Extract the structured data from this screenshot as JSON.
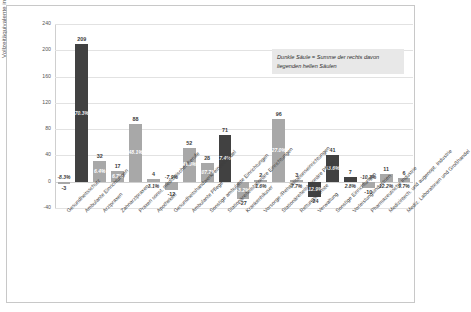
{
  "chart_data": {
    "type": "bar",
    "title": "",
    "xlabel": "",
    "ylabel": "Vollzeitäquivalente in Tausend",
    "ylim": [
      -40,
      240
    ],
    "yticks": [
      -40,
      0,
      40,
      80,
      120,
      160,
      200,
      240
    ],
    "grid": true,
    "legend": "none",
    "annotation": "Dunkle Säule = Summe der rechts davon liegenden hellen Säulen",
    "categories": [
      "Gesundheitsschutz",
      "Ambulante Einrichtungen",
      "Arztpraxen",
      "Zahnarztpraxen",
      "Praxen sonst. medizinischer Berufe",
      "Apotheken",
      "Gesundheitshandwerk/-einzelhandel",
      "Ambulante Pflege",
      "Sonstige ambulante Einrichtungen",
      "Stationäre/teilstationäre Einrichtungen",
      "Krankenhäuser",
      "Vorsorge-/Rehabilitationseinrichtungen",
      "Stationäre/teilstationäre Pflege",
      "Rettungsdienste",
      "Verwaltung",
      "Sonstige Einrichtungen",
      "Vorleistungsindustrien",
      "Pharmazeutische Industrie",
      "Medizintech. und augenopt. Industrie",
      "Mediz. Laboratorien und Großhandel"
    ],
    "bars": [
      {
        "category": "Gesundheitsschutz",
        "value": -3,
        "value_label": "-3",
        "percent_label": "-8.3%",
        "series": "light",
        "label_outside": true
      },
      {
        "category": "Ambulante Einrichtungen",
        "value": 209,
        "value_label": "209",
        "percent_label": "70.3%",
        "series": "dark",
        "label_outside": false
      },
      {
        "category": "Arztpraxen",
        "value": 32,
        "value_label": "32",
        "percent_label": "6.4%",
        "series": "light",
        "label_outside": false
      },
      {
        "category": "Zahnarztpraxen",
        "value": 17,
        "value_label": "17",
        "percent_label": "6.7%",
        "series": "light",
        "label_outside": false
      },
      {
        "category": "Praxen sonst. medizinischer Berufe",
        "value": 88,
        "value_label": "88",
        "percent_label": "48.1%",
        "series": "light",
        "label_outside": false
      },
      {
        "category": "Apotheken",
        "value": 4,
        "value_label": "4",
        "percent_label": "3.1%",
        "series": "light",
        "label_outside": true
      },
      {
        "category": "Gesundheitshandwerk/-einzelhandel",
        "value": -12,
        "value_label": "-12",
        "percent_label": "-7.9%",
        "series": "light",
        "label_outside": true
      },
      {
        "category": "Ambulante Pflege",
        "value": 52,
        "value_label": "52",
        "percent_label": "41.6%",
        "series": "light",
        "label_outside": false
      },
      {
        "category": "Sonstige ambulante Einrichtungen",
        "value": 28,
        "value_label": "28",
        "percent_label": "107.7%",
        "series": "light",
        "label_outside": false
      },
      {
        "category": "Stationäre/teilstationäre Einrichtungen",
        "value": 71,
        "value_label": "71",
        "percent_label": "7.4%",
        "series": "dark",
        "label_outside": false
      },
      {
        "category": "Krankenhäuser",
        "value": -27,
        "value_label": "-27",
        "percent_label": "-3.2%",
        "series": "light",
        "label_outside": false
      },
      {
        "category": "Vorsorge-/Rehabilitationseinrichtungen",
        "value": 2,
        "value_label": "2",
        "percent_label": "1.6%",
        "series": "light",
        "label_outside": true
      },
      {
        "category": "Stationäre/teilstationäre Pflege",
        "value": 96,
        "value_label": "96",
        "percent_label": "27.0%",
        "series": "light",
        "label_outside": false
      },
      {
        "category": "Rettungsdienste",
        "value": 3,
        "value_label": "3",
        "percent_label": "7.7%",
        "series": "light",
        "label_outside": true
      },
      {
        "category": "Verwaltung",
        "value": -24,
        "value_label": "-24",
        "percent_label": "-12.9%",
        "series": "dark",
        "label_outside": false
      },
      {
        "category": "Sonstige Einrichtungen",
        "value": 41,
        "value_label": "41",
        "percent_label": "43.6%",
        "series": "dark",
        "label_outside": false
      },
      {
        "category": "Vorleistungsindustrien",
        "value": 7,
        "value_label": "7",
        "percent_label": "2.8%",
        "series": "dark",
        "label_outside": true
      },
      {
        "category": "Pharmazeutische Industrie",
        "value": -10,
        "value_label": "-10",
        "percent_label": "-10.3%",
        "series": "light",
        "label_outside": true
      },
      {
        "category": "Medizintech. und augenopt. Industrie",
        "value": 11,
        "value_label": "11",
        "percent_label": "12.2%",
        "series": "light",
        "label_outside": true
      },
      {
        "category": "Mediz. Laboratorien und Großhandel",
        "value": 6,
        "value_label": "6",
        "percent_label": "9.7%",
        "series": "light",
        "label_outside": true
      }
    ]
  },
  "colors": {
    "dark_bar": "#414141",
    "light_bar": "#a8a8a8",
    "grid": "#e2e2e2",
    "note_background": "#e8e8e8",
    "frame_border": "#c8c8c8"
  }
}
